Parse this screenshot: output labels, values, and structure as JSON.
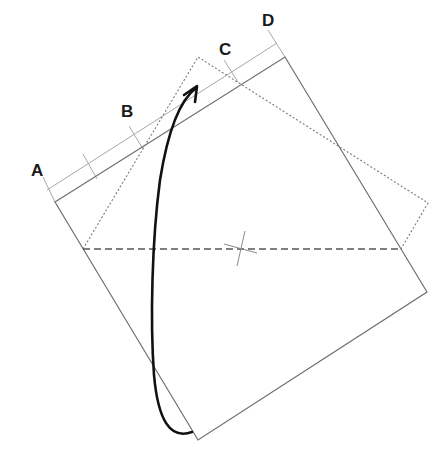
{
  "diagram": {
    "labels": [
      {
        "id": "A",
        "text": "A",
        "x": 31,
        "y": 176
      },
      {
        "id": "B",
        "text": "B",
        "x": 121,
        "y": 117
      },
      {
        "id": "C",
        "text": "C",
        "x": 219,
        "y": 55
      },
      {
        "id": "D",
        "text": "D",
        "x": 262,
        "y": 26
      }
    ],
    "colors": {
      "outline": "#6e6e6e",
      "dotted": "#7a7a7a",
      "dashed": "#555555",
      "arrow": "#111111",
      "guide": "#a8a8a8",
      "label": "#1a1a1a"
    }
  }
}
